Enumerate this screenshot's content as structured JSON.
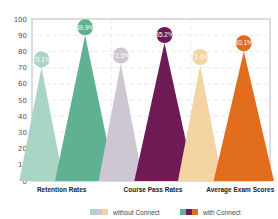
{
  "chart_data": {
    "type": "bar",
    "style": "triangle-peaks",
    "title": "",
    "xlabel": "",
    "ylabel": "",
    "ylim": [
      0,
      100
    ],
    "yticks": [
      0,
      10,
      20,
      30,
      40,
      50,
      60,
      70,
      80,
      90,
      100
    ],
    "grid": true,
    "legend_position": "bottom",
    "categories": [
      "Retention Rates",
      "Course Pass Rates",
      "Average Exam Scores"
    ],
    "series": [
      {
        "name": "without Connect",
        "values": [
          70.1,
          72.5,
          71.6
        ],
        "labels": [
          "70.1%",
          "72.5%",
          "71.6%"
        ],
        "colors": [
          "#a8d5c4",
          "#cfc6d3",
          "#f3d4a2"
        ]
      },
      {
        "name": "with Connect",
        "values": [
          89.9,
          85.2,
          80.1
        ],
        "labels": [
          "89.9%",
          "85.2%",
          "80.1%"
        ],
        "colors": [
          "#5fb192",
          "#6d1a55",
          "#e06c1c"
        ]
      }
    ]
  },
  "legend": {
    "without": "without Connect",
    "with": "with Connect"
  }
}
